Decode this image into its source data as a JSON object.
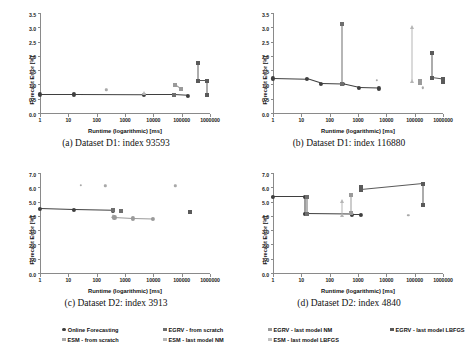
{
  "figure": {
    "axis_title_x": "Runtime (logarithmic) [ms]",
    "axis_title_y": "Forecast Error [%]"
  },
  "legend": {
    "items": [
      {
        "label": "Online Forecasting",
        "color": "#3f3f3f",
        "shape": "circ"
      },
      {
        "label": "ESM - from scratch",
        "color": "#a8a8a8",
        "shape": "sq"
      },
      {
        "label": "EGRV - from scratch",
        "color": "#6e6e6e",
        "shape": "sq"
      },
      {
        "label": "ESM - last model NM",
        "color": "#b5b5b5",
        "shape": "sq"
      },
      {
        "label": "EGRV - last model NM",
        "color": "#9a9a9a",
        "shape": "sq"
      },
      {
        "label": "ESM - last model LBFGS",
        "color": "#c2c2c2",
        "shape": "sq"
      },
      {
        "label": "EGRV - last model LBFGS",
        "color": "#5a5a5a",
        "shape": "sq"
      }
    ]
  },
  "chart_data": [
    {
      "type": "scatter",
      "panel": "a",
      "caption": "(a) Dataset D1: index 93593",
      "xlabel": "Runtime (logarithmic) [ms]",
      "ylabel": "Forecast Error [%]",
      "xscale": "log",
      "xlim": [
        1,
        1000000
      ],
      "ylim": [
        0.0,
        3.5
      ],
      "yticks": [
        "0.0",
        "0.5",
        "1.0",
        "1.5",
        "2.0",
        "2.5",
        "3.0",
        "3.5"
      ],
      "xticks": [
        "1",
        "10",
        "100",
        "1000",
        "10000",
        "100000",
        "1000000"
      ],
      "series": [
        {
          "name": "Online Forecasting",
          "color": "#3f3f3f",
          "shape": "circ",
          "line": true,
          "points": [
            [
              1,
              0.68
            ],
            [
              16,
              0.68
            ],
            [
              4500,
              0.67
            ],
            [
              55000,
              0.67
            ],
            [
              170000,
              0.64
            ]
          ]
        },
        {
          "name": "ESM - from scratch",
          "color": "#a8a8a8",
          "shape": "dot",
          "line": false,
          "points": [
            [
              220,
              0.85
            ]
          ]
        },
        {
          "name": "EGRV - from scratch",
          "color": "#6e6e6e",
          "shape": "sq",
          "line": false,
          "points": [
            [
              55000,
              0.68
            ],
            [
              380000,
              1.15
            ]
          ]
        },
        {
          "name": "ESM - last model NM",
          "color": "#b5b5b5",
          "shape": "tri",
          "line": false,
          "points": [
            [
              4500,
              0.72
            ]
          ]
        },
        {
          "name": "EGRV - last model NM",
          "color": "#9a9a9a",
          "shape": "sq",
          "line": true,
          "points": [
            [
              60000,
              1.02
            ],
            [
              95000,
              0.88
            ]
          ]
        },
        {
          "name": "ESM - last model LBFGS",
          "color": "#c2c2c2",
          "shape": "dot",
          "line": false,
          "points": [
            [
              800000,
              0.66
            ]
          ]
        },
        {
          "name": "EGRV - last model LBFGS",
          "color": "#5a5a5a",
          "shape": "sq",
          "line": true,
          "points": [
            [
              380000,
              1.8
            ],
            [
              380000,
              1.15
            ],
            [
              800000,
              1.15
            ],
            [
              800000,
              0.66
            ]
          ]
        }
      ]
    },
    {
      "type": "scatter",
      "panel": "b",
      "caption": "(b) Dataset D1: index 116880",
      "xlabel": "Runtime (logarithmic) [ms]",
      "ylabel": "Forecast Error [%]",
      "xscale": "log",
      "xlim": [
        1,
        1000000
      ],
      "ylim": [
        0.0,
        3.5
      ],
      "yticks": [
        "0.0",
        "0.5",
        "1.0",
        "1.5",
        "2.0",
        "2.5",
        "3.0",
        "3.5"
      ],
      "xticks": [
        "1",
        "10",
        "100",
        "1000",
        "10000",
        "100000",
        "1000000"
      ],
      "series": [
        {
          "name": "Online Forecasting",
          "color": "#3f3f3f",
          "shape": "circ",
          "line": true,
          "points": [
            [
              1,
              1.24
            ],
            [
              16,
              1.21
            ],
            [
              48,
              1.06
            ],
            [
              280,
              1.04
            ],
            [
              1100,
              0.91
            ],
            [
              5500,
              0.89
            ]
          ]
        },
        {
          "name": "ESM - from scratch",
          "color": "#a8a8a8",
          "shape": "dot",
          "line": false,
          "points": [
            [
              4500,
              1.18
            ],
            [
              190000,
              0.92
            ]
          ]
        },
        {
          "name": "EGRV - from scratch",
          "color": "#6e6e6e",
          "shape": "sq",
          "line": true,
          "points": [
            [
              280,
              3.15
            ],
            [
              280,
              1.04
            ]
          ]
        },
        {
          "name": "ESM - last model NM",
          "color": "#b5b5b5",
          "shape": "tri",
          "line": true,
          "points": [
            [
              80000,
              3.05
            ],
            [
              80000,
              1.16
            ]
          ]
        },
        {
          "name": "EGRV - last model NM",
          "color": "#9a9a9a",
          "shape": "sq",
          "line": false,
          "points": [
            [
              150000,
              1.17
            ],
            [
              150000,
              1.08
            ]
          ]
        },
        {
          "name": "ESM - last model LBFGS",
          "color": "#c2c2c2",
          "shape": "dot",
          "line": false,
          "points": [
            [
              1000000,
              1.12
            ]
          ]
        },
        {
          "name": "EGRV - last model LBFGS",
          "color": "#5a5a5a",
          "shape": "sq",
          "line": true,
          "points": [
            [
              420000,
              2.12
            ],
            [
              420000,
              1.27
            ],
            [
              1000000,
              1.22
            ],
            [
              1000000,
              1.12
            ]
          ]
        }
      ]
    },
    {
      "type": "scatter",
      "panel": "c",
      "caption": "(c) Dataset D2: index 3913",
      "xlabel": "Runtime (logarithmic) [ms]",
      "ylabel": "Forecast Error [%]",
      "xscale": "log",
      "xlim": [
        1,
        1000000
      ],
      "ylim": [
        0.0,
        7.0
      ],
      "yticks": [
        "0.0",
        "1.0",
        "2.0",
        "3.0",
        "4.0",
        "5.0",
        "6.0",
        "7.0"
      ],
      "xticks": [
        "1",
        "10",
        "100",
        "1000",
        "10000",
        "100000",
        "1000000"
      ],
      "series": [
        {
          "name": "Online Forecasting",
          "color": "#3f3f3f",
          "shape": "circ",
          "line": true,
          "points": [
            [
              1,
              4.55
            ],
            [
              16,
              4.48
            ],
            [
              380,
              4.42
            ]
          ]
        },
        {
          "name": "ESM - from scratch",
          "color": "#a8a8a8",
          "shape": "dot",
          "line": false,
          "points": [
            [
              28,
              6.22
            ],
            [
              200,
              6.18
            ],
            [
              60000,
              6.18
            ]
          ]
        },
        {
          "name": "EGRV - from scratch",
          "color": "#6e6e6e",
          "shape": "sq",
          "line": false,
          "points": [
            [
              380,
              4.45
            ],
            [
              700,
              4.42
            ]
          ]
        },
        {
          "name": "ESM - last model NM",
          "color": "#b5b5b5",
          "shape": "tri",
          "line": false,
          "points": [
            [
              380,
              4.05
            ]
          ]
        },
        {
          "name": "EGRV - last model NM",
          "color": "#9a9a9a",
          "shape": "circ",
          "line": true,
          "points": [
            [
              420,
              3.95
            ],
            [
              1900,
              3.88
            ],
            [
              9500,
              3.85
            ]
          ]
        },
        {
          "name": "ESM - last model LBFGS",
          "color": "#c2c2c2",
          "shape": "dot",
          "line": false,
          "points": [
            [
              200000,
              4.35
            ]
          ]
        },
        {
          "name": "EGRV - last model LBFGS",
          "color": "#5a5a5a",
          "shape": "sq",
          "line": false,
          "points": [
            [
              200000,
              4.35
            ]
          ]
        }
      ]
    },
    {
      "type": "scatter",
      "panel": "d",
      "caption": "(d) Dataset D2: index 4840",
      "xlabel": "Runtime (logarithmic) [ms]",
      "ylabel": "Forecast Error [%]",
      "xscale": "log",
      "xlim": [
        1,
        1000000
      ],
      "ylim": [
        0.0,
        7.0
      ],
      "yticks": [
        "0.0",
        "1.0",
        "2.0",
        "3.0",
        "4.0",
        "5.0",
        "6.0",
        "7.0"
      ],
      "xticks": [
        "1",
        "10",
        "100",
        "1000",
        "10000",
        "100000",
        "1000000"
      ],
      "series": [
        {
          "name": "Online Forecasting",
          "color": "#3f3f3f",
          "shape": "circ",
          "line": true,
          "points": [
            [
              1,
              5.38
            ],
            [
              13,
              5.38
            ],
            [
              13,
              4.18
            ],
            [
              600,
              4.15
            ],
            [
              1300,
              4.15
            ]
          ]
        },
        {
          "name": "ESM - from scratch",
          "color": "#a8a8a8",
          "shape": "dot",
          "line": false,
          "points": [
            [
              60000,
              4.12
            ]
          ]
        },
        {
          "name": "EGRV - from scratch",
          "color": "#6e6e6e",
          "shape": "sq",
          "line": true,
          "points": [
            [
              16,
              5.42
            ],
            [
              16,
              4.18
            ]
          ]
        },
        {
          "name": "ESM - last model NM",
          "color": "#b5b5b5",
          "shape": "tri",
          "line": true,
          "points": [
            [
              270,
              5.08
            ],
            [
              270,
              4.15
            ]
          ]
        },
        {
          "name": "EGRV - last model NM",
          "color": "#9a9a9a",
          "shape": "sq",
          "line": true,
          "points": [
            [
              580,
              5.55
            ],
            [
              580,
              4.28
            ]
          ]
        },
        {
          "name": "ESM - last model LBFGS",
          "color": "#c2c2c2",
          "shape": "dot",
          "line": false,
          "points": [
            [
              1300,
              6.05
            ]
          ]
        },
        {
          "name": "EGRV - last model LBFGS",
          "color": "#5a5a5a",
          "shape": "sq",
          "line": true,
          "points": [
            [
              1300,
              6.08
            ],
            [
              1300,
              5.88
            ],
            [
              200000,
              6.3
            ],
            [
              200000,
              4.82
            ]
          ]
        }
      ]
    }
  ]
}
